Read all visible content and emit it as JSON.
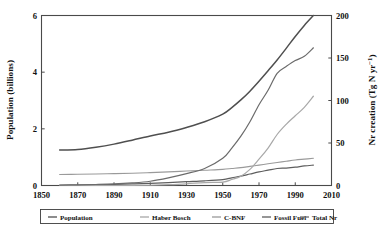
{
  "chart_data": {
    "type": "line",
    "title": "",
    "xlabel": "",
    "ylabel": "Population (billions)",
    "y2label": "Nr creation (Tg N yr−1)",
    "xlim": [
      1850,
      2010
    ],
    "ylim": [
      0,
      6
    ],
    "y2lim": [
      0,
      200
    ],
    "grid": false,
    "legend_position": "below-plot",
    "xticks": [
      "1850",
      "1870",
      "1890",
      "1910",
      "1930",
      "1950",
      "1970",
      "1990",
      "2010"
    ],
    "xtick_values": [
      1850,
      1870,
      1890,
      1910,
      1930,
      1950,
      1970,
      1990,
      2010
    ],
    "yticks": [
      "0",
      "2",
      "4",
      "6"
    ],
    "ytick_values": [
      0,
      2,
      4,
      6
    ],
    "y2ticks": [
      "0",
      "50",
      "100",
      "150",
      "200"
    ],
    "y2tick_values": [
      0,
      50,
      100,
      150,
      200
    ],
    "x": [
      1860,
      1870,
      1880,
      1890,
      1900,
      1910,
      1920,
      1930,
      1940,
      1950,
      1955,
      1960,
      1965,
      1970,
      1975,
      1980,
      1985,
      1990,
      1995,
      2000
    ],
    "series": [
      {
        "name": "Population",
        "axis": "left",
        "units": "billions",
        "color": "#4f4f4f",
        "width": 1.5,
        "values": [
          1.25,
          1.27,
          1.35,
          1.46,
          1.6,
          1.75,
          1.88,
          2.05,
          2.25,
          2.52,
          2.75,
          3.02,
          3.33,
          3.68,
          4.05,
          4.43,
          4.84,
          5.26,
          5.65,
          6.0
        ]
      },
      {
        "name": "Total Nr",
        "axis": "right",
        "units": "Tg N yr-1",
        "color": "#6b6b6b",
        "width": 1.2,
        "values": [
          0.5,
          0.8,
          1.2,
          1.8,
          3.0,
          5.0,
          9.0,
          14.0,
          20.0,
          32.0,
          44.0,
          58.0,
          75.0,
          95.0,
          112.0,
          132.0,
          140.0,
          147.0,
          152.0,
          162.0
        ]
      },
      {
        "name": "Haber Bosch",
        "axis": "right",
        "units": "Tg N yr-1",
        "color": "#a8a8a8",
        "width": 1.2,
        "values": [
          0.0,
          0.0,
          0.0,
          0.0,
          0.0,
          0.3,
          1.0,
          2.0,
          3.5,
          4.0,
          7.0,
          11.0,
          19.0,
          31.0,
          44.0,
          60.0,
          72.0,
          82.0,
          92.0,
          105.0
        ]
      },
      {
        "name": "C-BNF",
        "axis": "right",
        "units": "Tg N yr-1",
        "color": "#9a9a9a",
        "width": 1.1,
        "values": [
          13.0,
          13.2,
          13.5,
          14.0,
          14.5,
          15.2,
          16.0,
          17.0,
          18.0,
          19.0,
          20.0,
          21.0,
          22.5,
          24.0,
          25.5,
          27.0,
          28.5,
          30.0,
          31.0,
          32.0
        ]
      },
      {
        "name": "Fossil Fuel",
        "axis": "right",
        "units": "Tg N yr-1",
        "color": "#5e5e5e",
        "width": 1.2,
        "values": [
          0.3,
          0.5,
          0.8,
          1.2,
          1.8,
          2.5,
          3.5,
          4.5,
          5.5,
          7.0,
          9.0,
          11.0,
          13.5,
          16.0,
          18.0,
          20.0,
          20.5,
          21.5,
          23.0,
          24.0
        ]
      }
    ],
    "legend": [
      {
        "label": "Population",
        "color": "#4f4f4f"
      },
      {
        "label": "Haber Bosch",
        "color": "#a8a8a8"
      },
      {
        "label": "C-BNF",
        "color": "#9a9a9a"
      },
      {
        "label": "Fossil Fuel",
        "color": "#5e5e5e"
      },
      {
        "label": "Total Nr",
        "color": "#6b6b6b"
      }
    ]
  }
}
